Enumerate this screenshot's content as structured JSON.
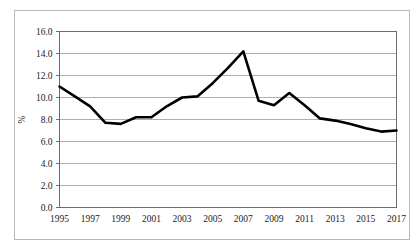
{
  "figure": {
    "caption_fragment": "",
    "background_color": "#ffffff",
    "frame_color": "#b8b8b8"
  },
  "chart_data": {
    "type": "line",
    "title": "",
    "subtitle": "",
    "xlabel": "",
    "ylabel": "%",
    "ylim": [
      0.0,
      16.0
    ],
    "ytick_step": 2.0,
    "ytick_labels": [
      "0.0",
      "2.0",
      "4.0",
      "6.0",
      "8.0",
      "10.0",
      "12.0",
      "14.0",
      "16.0"
    ],
    "ytick_values": [
      0.0,
      2.0,
      4.0,
      6.0,
      8.0,
      10.0,
      12.0,
      14.0,
      16.0
    ],
    "xlim": [
      1995,
      2017
    ],
    "xtick_labels": [
      "1995",
      "1997",
      "1999",
      "2001",
      "2003",
      "2005",
      "2007",
      "2009",
      "2011",
      "2013",
      "2015",
      "2017"
    ],
    "xtick_values": [
      1995,
      1997,
      1999,
      2001,
      2003,
      2005,
      2007,
      2009,
      2011,
      2013,
      2015,
      2017
    ],
    "grid": "horizontal",
    "legend": "none",
    "x": [
      1995,
      1996,
      1997,
      1998,
      1999,
      2000,
      2001,
      2002,
      2003,
      2004,
      2005,
      2006,
      2007,
      2008,
      2009,
      2010,
      2011,
      2012,
      2013,
      2014,
      2015,
      2016,
      2017
    ],
    "values": [
      11.0,
      10.1,
      9.2,
      7.7,
      7.6,
      8.2,
      8.2,
      9.2,
      10.0,
      10.1,
      11.3,
      12.7,
      14.2,
      9.7,
      9.3,
      10.4,
      9.3,
      8.1,
      7.9,
      7.6,
      7.2,
      6.9,
      7.0
    ],
    "series": [
      {
        "name": "",
        "color": "#000000",
        "line_width": 2.6,
        "marker": "none",
        "values": [
          11.0,
          10.1,
          9.2,
          7.7,
          7.6,
          8.2,
          8.2,
          9.2,
          10.0,
          10.1,
          11.3,
          12.7,
          14.2,
          9.7,
          9.3,
          10.4,
          9.3,
          8.1,
          7.9,
          7.6,
          7.2,
          6.9,
          7.0
        ]
      }
    ],
    "gridline_color": "#9a9a9a",
    "axis_color": "#6d6d6d",
    "series_color": "#000000"
  }
}
